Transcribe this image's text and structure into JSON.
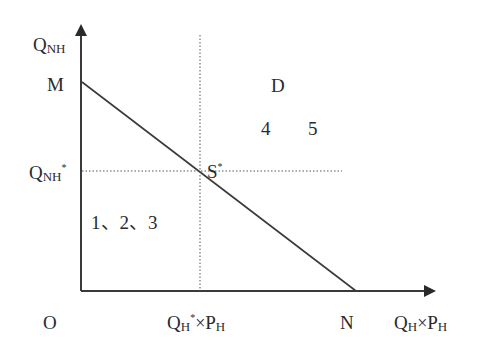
{
  "diagram": {
    "y_axis": {
      "label_main": "Q",
      "label_sub": "NH"
    },
    "x_axis": {
      "label_q": "Q",
      "label_q_sub": "H",
      "times": "×",
      "label_p": "P",
      "label_p_sub": "H"
    },
    "origin": "O",
    "point_m": "M",
    "point_n": "N",
    "point_s": {
      "main": "S",
      "sup": "*"
    },
    "y_star": {
      "main": "Q",
      "sub": "NH",
      "sup": "*"
    },
    "x_star": {
      "q": "Q",
      "q_sub": "H",
      "sup": "*",
      "times": "×",
      "p": "P",
      "p_sub": "H"
    },
    "region_d": "D",
    "region_upper_numbers": [
      "4",
      "5"
    ],
    "region_lower_numbers": "1、2、3",
    "colors": {
      "line": "#3a3a3a",
      "dotted": "#555555",
      "text": "#2a2a2a"
    }
  }
}
